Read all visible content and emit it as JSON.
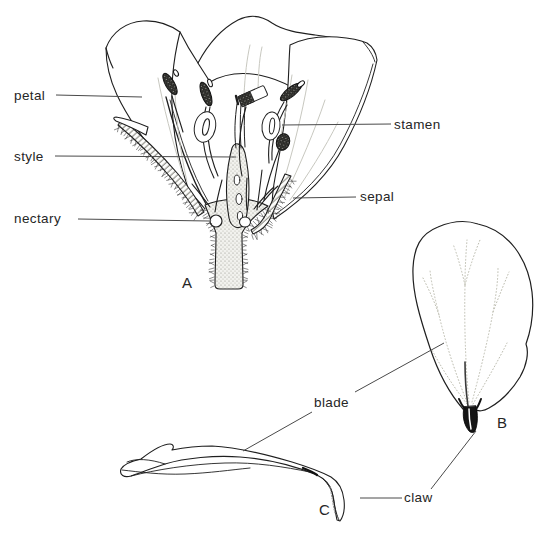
{
  "diagram": {
    "type": "botanical line illustration (crucifer flower)",
    "labels": {
      "petal": "petal",
      "style": "style",
      "nectary": "nectary",
      "stamen": "stamen",
      "sepal": "sepal",
      "blade": "blade",
      "claw": "claw"
    },
    "panels": {
      "a": "A",
      "b": "B",
      "c": "C"
    }
  },
  "colors": {
    "background": "#ffffff",
    "ink": "#1f1f1f",
    "label_text": "#262626",
    "leader_line": "#4a4a4a",
    "vein_faint": "#c8c8c0",
    "hatch_gray": "#6e6e66",
    "stipple_gray": "#8f8f85"
  }
}
